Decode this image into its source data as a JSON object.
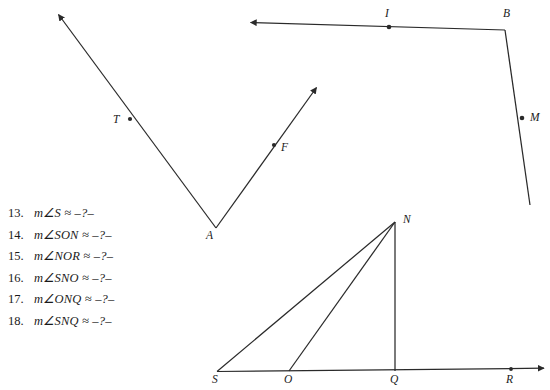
{
  "page": {
    "background_color": "#ffffff",
    "ink_color": "#2a2a2a",
    "text_color": "#1a1a1a"
  },
  "problem_list": {
    "items": [
      {
        "number": "13.",
        "expression": "m∠S ≈ –?–"
      },
      {
        "number": "14.",
        "expression": "m∠SON ≈ –?–"
      },
      {
        "number": "15.",
        "expression": "m∠NOR ≈ –?–"
      },
      {
        "number": "16.",
        "expression": "m∠SNO ≈ –?–"
      },
      {
        "number": "17.",
        "expression": "m∠ONQ ≈ –?–"
      },
      {
        "number": "18.",
        "expression": "m∠SNQ ≈ –?–"
      }
    ]
  },
  "figures": {
    "angle_taf": {
      "name": "angle-TAF",
      "vertex_label": "A",
      "point_labels": [
        "T",
        "F"
      ],
      "vertex": {
        "x": 216,
        "y": 228
      },
      "ray_t_end": {
        "x": 57,
        "y": 13
      },
      "ray_f_end": {
        "x": 318,
        "y": 86
      },
      "point_t": {
        "x": 130,
        "y": 119
      },
      "point_f": {
        "x": 274,
        "y": 145
      },
      "label_a_pos": {
        "x": 206,
        "y": 230
      },
      "label_t_pos": {
        "x": 113,
        "y": 114
      },
      "label_f_pos": {
        "x": 281,
        "y": 142
      }
    },
    "angle_ibm": {
      "name": "angle-IBM",
      "vertex_label": "B",
      "point_labels": [
        "I",
        "M"
      ],
      "vertex": {
        "x": 505,
        "y": 30
      },
      "ray_i_end": {
        "x": 249,
        "y": 22
      },
      "ray_m_end": {
        "x": 530,
        "y": 205
      },
      "point_i": {
        "x": 389,
        "y": 27
      },
      "point_m": {
        "x": 522,
        "y": 118
      },
      "label_b_pos": {
        "x": 503,
        "y": 8
      },
      "label_i_pos": {
        "x": 385,
        "y": 8
      },
      "label_m_pos": {
        "x": 530,
        "y": 112
      }
    },
    "triangle_snq": {
      "name": "figure-SONQR",
      "point_labels": [
        "S",
        "O",
        "Q",
        "R",
        "N"
      ],
      "apex_n": {
        "x": 395,
        "y": 222
      },
      "point_s": {
        "x": 217,
        "y": 371
      },
      "point_o": {
        "x": 289,
        "y": 371
      },
      "point_q": {
        "x": 395,
        "y": 371
      },
      "point_r": {
        "x": 511,
        "y": 369
      },
      "baseline_arrow_end": {
        "x": 546,
        "y": 368
      },
      "label_n_pos": {
        "x": 403,
        "y": 214
      },
      "label_s_pos": {
        "x": 212,
        "y": 374
      },
      "label_o_pos": {
        "x": 284,
        "y": 374
      },
      "label_q_pos": {
        "x": 390,
        "y": 374
      },
      "label_r_pos": {
        "x": 506,
        "y": 374
      }
    }
  }
}
